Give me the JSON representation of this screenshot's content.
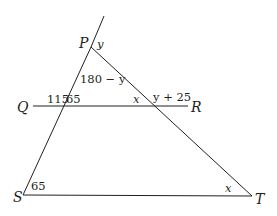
{
  "diagram": {
    "type": "geometry",
    "colors": {
      "stroke": "#231f20",
      "background": "#ffffff"
    },
    "points": {
      "P": "P",
      "Q": "Q",
      "R": "R",
      "S": "S",
      "T": "T"
    },
    "angles": {
      "at_P_exterior": "y",
      "at_P_interior": "180 − y",
      "QR_left_exterior": "115",
      "QR_left_interior": "65",
      "QR_right_interior": "x",
      "QR_right_exterior": "y + 25",
      "at_S": "65",
      "at_T": "x"
    }
  }
}
